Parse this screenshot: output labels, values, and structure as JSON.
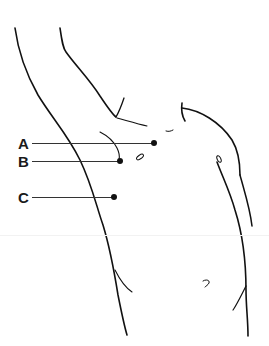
{
  "diagram": {
    "labels": [
      {
        "id": "A",
        "text": "A",
        "label_x": 18,
        "label_y": 137,
        "line_from_x": 32,
        "line_to_x": 154,
        "line_y": 143,
        "dot_x": 154,
        "dot_y": 143
      },
      {
        "id": "B",
        "text": "B",
        "label_x": 18,
        "label_y": 155,
        "line_from_x": 32,
        "line_to_x": 120,
        "line_y": 161,
        "dot_x": 120,
        "dot_y": 161
      },
      {
        "id": "C",
        "text": "C",
        "label_x": 18,
        "label_y": 191,
        "line_from_x": 32,
        "line_to_x": 114,
        "line_y": 197,
        "dot_x": 114,
        "dot_y": 197
      }
    ],
    "colors": {
      "stroke": "#111111",
      "leader": "#333333",
      "background": "#ffffff"
    }
  }
}
